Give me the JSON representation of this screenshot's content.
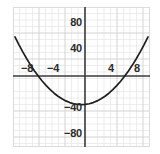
{
  "chart_data": {
    "type": "line",
    "title": "",
    "subtitle": "",
    "xlabel": "",
    "ylabel": "",
    "xlim": [
      -10.5,
      10.5
    ],
    "ylim": [
      -107,
      108
    ],
    "grid": true,
    "grid_minor_step_x": 1,
    "grid_minor_step_y": 10,
    "grid_major_step_x": 4,
    "grid_major_step_y": 40,
    "legend": "none",
    "axis_color": "#3a3a3a",
    "curve_color": "#1f1f1f",
    "grid_minor_color": "#e8e8e8",
    "grid_major_color": "#d2d2d2",
    "background": "#ffffff",
    "x_ticks": [
      {
        "value": -8,
        "label": "−8"
      },
      {
        "value": -4,
        "label": "−4"
      },
      {
        "value": 4,
        "label": "4"
      },
      {
        "value": 8,
        "label": "8"
      }
    ],
    "y_ticks": [
      {
        "value": 80,
        "label": "80"
      },
      {
        "value": 40,
        "label": "40"
      },
      {
        "value": -40,
        "label": "−40"
      },
      {
        "value": -80,
        "label": "−80"
      }
    ],
    "series": [
      {
        "name": "parabola",
        "equation": "y = x^2 - 42",
        "vertex": [
          0,
          -42
        ],
        "x_intercepts": [
          -6.5,
          6.5
        ],
        "x": [
          -10.2,
          -9.6,
          -9.0,
          -8.4,
          -7.8,
          -7.2,
          -6.6,
          -6.0,
          -5.4,
          -4.8,
          -4.2,
          -3.6,
          -3.0,
          -2.4,
          -1.8,
          -1.2,
          -0.6,
          0,
          0.6,
          1.2,
          1.8,
          2.4,
          3.0,
          3.6,
          4.2,
          4.8,
          5.4,
          6.0,
          6.6,
          7.2,
          7.8,
          8.4,
          9.0,
          9.6,
          10.2
        ],
        "y": [
          62.0,
          50.2,
          39.0,
          28.6,
          18.8,
          9.8,
          1.6,
          -6.0,
          -12.8,
          -19.0,
          -24.4,
          -29.0,
          -33.0,
          -36.2,
          -38.8,
          -40.6,
          -41.6,
          -42.0,
          -41.6,
          -40.6,
          -38.8,
          -36.2,
          -33.0,
          -29.0,
          -24.4,
          -19.0,
          -12.8,
          -6.0,
          1.6,
          9.8,
          18.8,
          28.6,
          39.0,
          50.2,
          62.0
        ]
      }
    ]
  }
}
